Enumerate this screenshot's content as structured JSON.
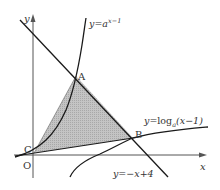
{
  "diagram": {
    "axes": {
      "x_label": "x",
      "y_label": "y",
      "origin_label": "O"
    },
    "points": {
      "A": "A",
      "B": "B",
      "C": "C"
    },
    "curves": {
      "exponential": {
        "prefix": "y=",
        "base": "a",
        "exponent": "x−1"
      },
      "logarithm": {
        "prefix": "y=log",
        "base": "a",
        "argument": "(x−1)"
      },
      "line": {
        "label": "y=−x+4"
      }
    },
    "shaded_region": "triangle ABC",
    "colors": {
      "stroke": "#1a1a1a",
      "axis": "#555555",
      "shade": "#b8b8b8",
      "label": "#333333"
    }
  }
}
